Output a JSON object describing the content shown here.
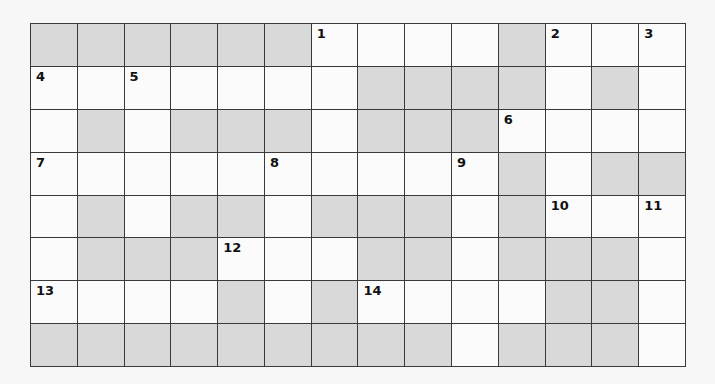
{
  "puzzle": {
    "rows": 8,
    "cols": 14,
    "colors": {
      "block": "#d9d9d9",
      "open": "#fbfbfb",
      "line": "#3a3a3a",
      "background": "#f7f7f7"
    },
    "grid": [
      [
        "#",
        "#",
        "#",
        "#",
        "#",
        "#",
        "1",
        ".",
        ".",
        ".",
        "#",
        "2",
        ".",
        "3"
      ],
      [
        "4",
        ".",
        "5",
        ".",
        ".",
        ".",
        ".",
        "#",
        "#",
        "#",
        "#",
        ".",
        "#",
        "."
      ],
      [
        ".",
        "#",
        ".",
        "#",
        "#",
        "#",
        ".",
        "#",
        "#",
        "#",
        "6",
        ".",
        ".",
        "."
      ],
      [
        "7",
        ".",
        ".",
        ".",
        ".",
        "8",
        ".",
        ".",
        ".",
        "9",
        "#",
        ".",
        "#",
        "#"
      ],
      [
        ".",
        "#",
        ".",
        "#",
        "#",
        ".",
        "#",
        "#",
        "#",
        ".",
        "#",
        "10",
        ".",
        "11"
      ],
      [
        ".",
        "#",
        "#",
        "#",
        "12",
        ".",
        ".",
        "#",
        "#",
        ".",
        "#",
        "#",
        "#",
        "."
      ],
      [
        "13",
        ".",
        ".",
        ".",
        "#",
        ".",
        "#",
        "14",
        ".",
        ".",
        ".",
        "#",
        "#",
        "."
      ],
      [
        "#",
        "#",
        "#",
        "#",
        "#",
        "#",
        "#",
        "#",
        "#",
        ".",
        "#",
        "#",
        "#",
        "."
      ]
    ],
    "clue_numbers": [
      "1",
      "2",
      "3",
      "4",
      "5",
      "6",
      "7",
      "8",
      "9",
      "10",
      "11",
      "12",
      "13",
      "14"
    ]
  }
}
